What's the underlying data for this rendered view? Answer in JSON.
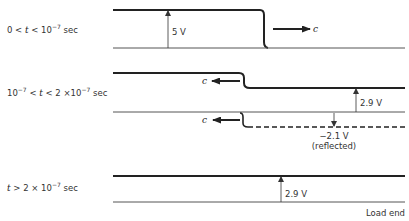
{
  "colors": {
    "ink": "#222222",
    "thin": "#555555",
    "background": "#ffffff"
  },
  "panels": [
    {
      "time_label": {
        "prefix": "0 < ",
        "var": "t",
        "mid": " < 10",
        "exp": "−7",
        "suffix": " sec"
      },
      "voltage_label": "5 V",
      "wave_label": "c",
      "wave_direction": "right"
    },
    {
      "time_label": {
        "prefix": "10",
        "exp": "−7",
        "mid": " < ",
        "var": "t",
        "mid2": " < 2 ×10",
        "exp2": "−7",
        "suffix": " sec"
      },
      "voltage_label": "2.9 V",
      "wave_label": "c",
      "wave_direction": "left",
      "reflected_voltage_label": "−2.1 V",
      "reflected_note": "(reflected)",
      "reflected_wave_label": "c"
    },
    {
      "time_label": {
        "var": "t",
        "mid": " > 2 × 10",
        "exp": "−7",
        "suffix": " sec"
      },
      "voltage_label": "2.9 V"
    }
  ],
  "load_end_label": "Load end"
}
